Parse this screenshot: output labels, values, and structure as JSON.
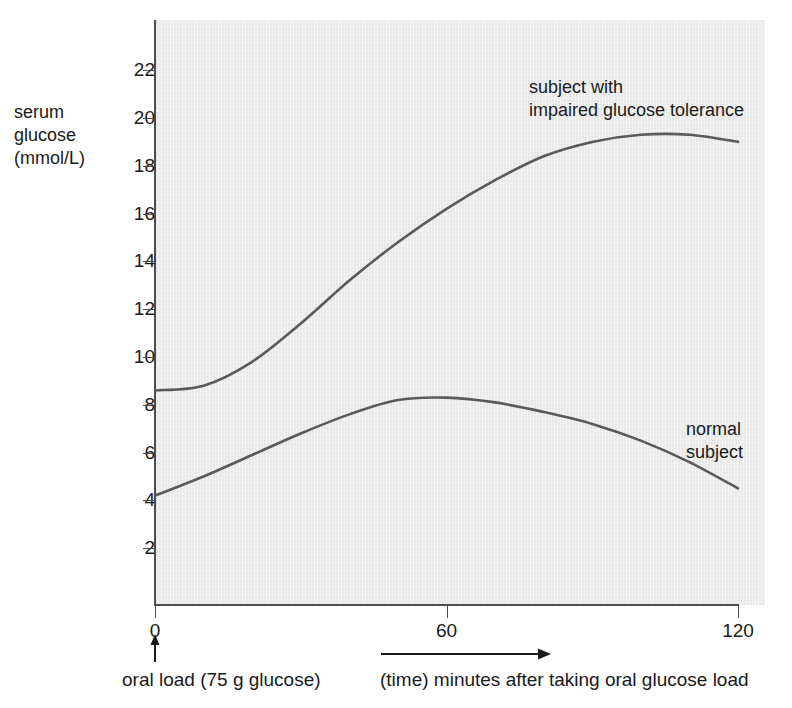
{
  "chart_data": {
    "type": "line",
    "title": "",
    "xlabel": "(time) minutes after taking oral glucose load",
    "ylabel": "serum glucose (mmol/L)",
    "xlim": [
      0,
      120
    ],
    "ylim": [
      0,
      23
    ],
    "grid": false,
    "legend_position": "inline-annotations",
    "x_ticks": [
      "0",
      "60",
      "120"
    ],
    "x_tick_values": [
      0,
      60,
      120
    ],
    "y_ticks": [
      "2",
      "4",
      "6",
      "8",
      "10",
      "12",
      "14",
      "16",
      "18",
      "20",
      "22"
    ],
    "y_tick_values": [
      2,
      4,
      6,
      8,
      10,
      12,
      14,
      16,
      18,
      20,
      22
    ],
    "x": [
      0,
      10,
      20,
      30,
      40,
      50,
      60,
      70,
      80,
      90,
      100,
      110,
      120
    ],
    "series": [
      {
        "name": "subject with impaired glucose tolerance",
        "values": [
          8.6,
          8.8,
          9.8,
          11.4,
          13.2,
          14.8,
          16.2,
          17.4,
          18.4,
          19.0,
          19.3,
          19.3,
          19.0
        ]
      },
      {
        "name": "normal subject",
        "values": [
          4.2,
          5.0,
          5.9,
          6.8,
          7.6,
          8.2,
          8.3,
          8.1,
          7.7,
          7.2,
          6.5,
          5.6,
          4.5
        ]
      }
    ],
    "annotations": [
      {
        "id": "impaired",
        "text_lines": [
          "subject with",
          "impaired glucose tolerance"
        ]
      },
      {
        "id": "normal",
        "text_lines": [
          "normal",
          "subject"
        ]
      },
      {
        "id": "oral-load",
        "text": "oral load (75 g glucose)",
        "marker": "up-arrow-at-x-0"
      },
      {
        "id": "time-axis",
        "text": "(time) minutes after taking oral glucose load",
        "marker": "right-arrow"
      }
    ],
    "colors": {
      "panel_background": "#ebebeb",
      "axis": "#4d4d4d",
      "curve": "#5a5a5a",
      "text": "#1a1a1a"
    }
  },
  "axis": {
    "y_title_lines": [
      "serum",
      "glucose",
      "(mmol/L)"
    ],
    "y_title": "serum\nglucose\n(mmol/L)"
  },
  "labels": {
    "impaired": "subject with\nimpaired glucose tolerance",
    "normal": "normal\nsubject"
  },
  "captions": {
    "oral_load": "oral load (75 g glucose)",
    "time": "(time) minutes after taking oral glucose load"
  }
}
